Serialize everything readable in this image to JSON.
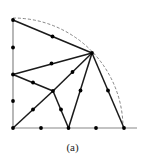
{
  "caption": "(a)",
  "colors": {
    "edge": "#1a1a1a",
    "node": "#000000",
    "arc": "#777777",
    "axis": "#888888"
  },
  "arc": {
    "cx": 13,
    "cy": 128,
    "r": 110
  },
  "axes": {
    "x_end": 137,
    "y_top": 18
  },
  "nodes": [
    {
      "id": "O",
      "x": 13,
      "y": 128
    },
    {
      "id": "B1",
      "x": 41,
      "y": 128
    },
    {
      "id": "B2",
      "x": 68.5,
      "y": 128
    },
    {
      "id": "B3",
      "x": 96,
      "y": 128
    },
    {
      "id": "B4",
      "x": 124,
      "y": 128
    },
    {
      "id": "L1",
      "x": 13,
      "y": 101
    },
    {
      "id": "L2",
      "x": 13,
      "y": 74.5
    },
    {
      "id": "L3",
      "x": 13,
      "y": 47.5
    },
    {
      "id": "L4",
      "x": 13,
      "y": 20
    },
    {
      "id": "A",
      "x": 92,
      "y": 53
    },
    {
      "id": "C",
      "x": 53,
      "y": 91
    },
    {
      "id": "m_L4A",
      "x": 52.5,
      "y": 36.5
    },
    {
      "id": "m_L2A",
      "x": 51.5,
      "y": 63.5
    },
    {
      "id": "m_L2C",
      "x": 33,
      "y": 82.5
    },
    {
      "id": "m_OC",
      "x": 33,
      "y": 109.5
    },
    {
      "id": "m_CA",
      "x": 72.5,
      "y": 72
    },
    {
      "id": "m_CB2",
      "x": 61,
      "y": 109.5
    },
    {
      "id": "m_B2A",
      "x": 80.5,
      "y": 90.5
    },
    {
      "id": "m_AB4",
      "x": 108,
      "y": 90.5
    }
  ],
  "edges": [
    [
      "L4",
      "A"
    ],
    [
      "L2",
      "A"
    ],
    [
      "L2",
      "C"
    ],
    [
      "O",
      "C"
    ],
    [
      "C",
      "A"
    ],
    [
      "C",
      "B2"
    ],
    [
      "B2",
      "A"
    ],
    [
      "A",
      "B4"
    ]
  ]
}
